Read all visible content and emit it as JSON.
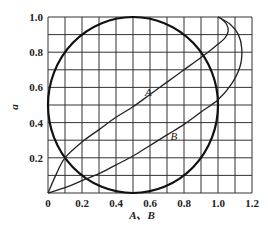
{
  "chart_data": {
    "type": "line",
    "title": "",
    "xlabel": "A、B",
    "ylabel": "a",
    "xlim": [
      0,
      1.2
    ],
    "ylim": [
      0,
      1.0
    ],
    "grid": true,
    "grid_step_x": 0.1,
    "grid_step_y": 0.1,
    "x_ticks": [
      "0",
      "0.2",
      "0.4",
      "0.6",
      "0.8",
      "1.0",
      "1.2"
    ],
    "y_ticks": [
      "0.2",
      "0.4",
      "0.6",
      "0.8",
      "1.0"
    ],
    "legend": null,
    "series": [
      {
        "name": "circle",
        "style": "thick",
        "center": [
          0.5,
          0.5
        ],
        "radius": 0.5
      },
      {
        "name": "A",
        "label": "A",
        "label_pos": [
          0.57,
          0.55
        ],
        "points": [
          [
            0,
            0
          ],
          [
            0.05,
            0.11
          ],
          [
            0.1,
            0.2
          ],
          [
            0.2,
            0.29
          ],
          [
            0.3,
            0.36
          ],
          [
            0.4,
            0.43
          ],
          [
            0.5,
            0.49
          ],
          [
            0.6,
            0.56
          ],
          [
            0.7,
            0.63
          ],
          [
            0.8,
            0.7
          ],
          [
            0.9,
            0.77
          ],
          [
            0.98,
            0.83
          ],
          [
            1.04,
            0.88
          ],
          [
            1.06,
            0.92
          ],
          [
            1.05,
            0.96
          ],
          [
            1.02,
            0.99
          ],
          [
            1.0,
            1.0
          ]
        ]
      },
      {
        "name": "B",
        "label": "B",
        "label_pos": [
          0.72,
          0.3
        ],
        "points": [
          [
            0,
            0
          ],
          [
            0.1,
            0.03
          ],
          [
            0.2,
            0.07
          ],
          [
            0.3,
            0.11
          ],
          [
            0.4,
            0.16
          ],
          [
            0.5,
            0.21
          ],
          [
            0.6,
            0.27
          ],
          [
            0.7,
            0.33
          ],
          [
            0.8,
            0.39
          ],
          [
            0.9,
            0.46
          ],
          [
            1.0,
            0.53
          ],
          [
            1.08,
            0.62
          ],
          [
            1.13,
            0.72
          ],
          [
            1.14,
            0.82
          ],
          [
            1.12,
            0.9
          ],
          [
            1.07,
            0.96
          ],
          [
            1.0,
            1.0
          ]
        ]
      }
    ]
  }
}
